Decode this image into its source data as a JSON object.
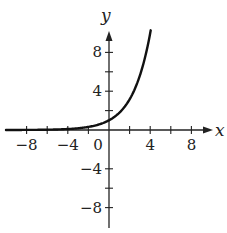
{
  "chart_data": {
    "type": "line",
    "title": "",
    "xlabel": "x",
    "ylabel": "y",
    "xlim": [
      -10,
      10
    ],
    "ylim": [
      -10,
      11
    ],
    "grid": false,
    "legend": null,
    "x_ticks": [
      -8,
      -6,
      -4,
      -2,
      0,
      2,
      4,
      6,
      8
    ],
    "x_tick_labels": [
      {
        "value": -8,
        "label": "−8"
      },
      {
        "value": -4,
        "label": "−4"
      },
      {
        "value": 0,
        "label": "0"
      },
      {
        "value": 4,
        "label": "4"
      },
      {
        "value": 8,
        "label": "8"
      }
    ],
    "y_ticks": [
      -8,
      -6,
      -4,
      2,
      4,
      6,
      8
    ],
    "y_tick_labels": [
      {
        "value": 8,
        "label": "8"
      },
      {
        "value": 4,
        "label": "4"
      },
      {
        "value": -4,
        "label": "−4"
      },
      {
        "value": -8,
        "label": "−8"
      }
    ],
    "series": [
      {
        "name": "exponential curve",
        "color": "#111111",
        "x": [
          -10,
          -8,
          -6,
          -4,
          -3,
          -2,
          -1,
          0,
          1,
          2,
          3,
          3.5,
          4.05
        ],
        "y": [
          0.0,
          0.01,
          0.03,
          0.1,
          0.18,
          0.32,
          0.56,
          1.0,
          1.78,
          3.16,
          5.62,
          7.5,
          10.3
        ]
      }
    ]
  }
}
